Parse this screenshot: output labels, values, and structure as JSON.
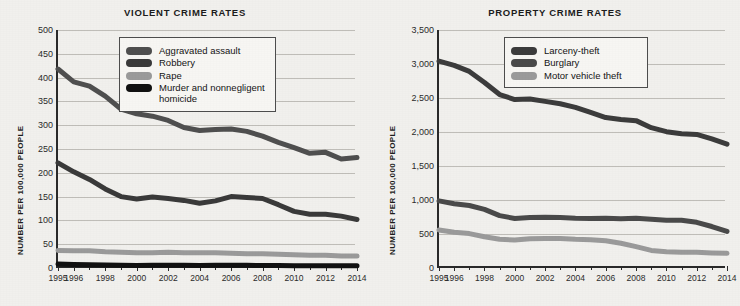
{
  "colors": {
    "background": "#f1f0ed",
    "axis": "#2a2a2a",
    "grid": "#bfbdb8",
    "series_dark_gray": "#4f4f4f",
    "series_darker_gray": "#3a3a3a",
    "series_light_gray": "#9a9a9a",
    "series_black": "#111111",
    "legend_bg": "#f7f6f3",
    "legend_border": "#4d4d4d"
  },
  "panels": [
    {
      "id": "violent-crime",
      "title": "VIOLENT CRIME RATES",
      "ylabel": "NUMBER PER 100,000 PEOPLE",
      "legend": {
        "items": [
          {
            "label": "Aggravated assault",
            "color": "#4f4f4f"
          },
          {
            "label": "Robbery",
            "color": "#3a3a3a"
          },
          {
            "label": "Rape",
            "color": "#9a9a9a"
          },
          {
            "label": "Murder and nonnegligent\nhomicide",
            "color": "#111111"
          }
        ]
      },
      "chart_data": {
        "type": "line",
        "title": "VIOLENT CRIME RATES",
        "xlabel": "",
        "ylabel": "NUMBER PER 100,000 PEOPLE",
        "ylim": [
          0,
          500
        ],
        "yticks": [
          0,
          50,
          100,
          150,
          200,
          250,
          300,
          350,
          400,
          450,
          500
        ],
        "ytick_labels": [
          "0",
          "50",
          "100",
          "150",
          "200",
          "250",
          "300",
          "350",
          "400",
          "450",
          "500"
        ],
        "xlim": [
          1995,
          2014
        ],
        "x": [
          1995,
          1996,
          1997,
          1998,
          1999,
          2000,
          2001,
          2002,
          2003,
          2004,
          2005,
          2006,
          2007,
          2008,
          2009,
          2010,
          2011,
          2012,
          2013,
          2014
        ],
        "xticks": [
          1995,
          1996,
          1998,
          2000,
          2002,
          2004,
          2006,
          2008,
          2010,
          2012,
          2014
        ],
        "xtick_labels": [
          "1995",
          "1996",
          "1998",
          "2000",
          "2002",
          "2004",
          "2006",
          "2008",
          "2010",
          "2012",
          "2014"
        ],
        "grid": true,
        "legend_position": "top-right",
        "series": [
          {
            "name": "Aggravated assault",
            "color": "#4f4f4f",
            "values": [
              418,
              391,
              382,
              361,
              334,
              324,
              319,
              310,
              295,
              289,
              291,
              292,
              287,
              277,
              264,
              253,
              241,
              243,
              229,
              232
            ]
          },
          {
            "name": "Robbery",
            "color": "#3a3a3a",
            "values": [
              221,
              202,
              186,
              166,
              150,
              145,
              149,
              146,
              142,
              136,
              141,
              150,
              148,
              146,
              133,
              119,
              113,
              113,
              109,
              102
            ]
          },
          {
            "name": "Rape",
            "color": "#9a9a9a",
            "values": [
              37,
              36,
              36,
              34,
              33,
              32,
              32,
              33,
              32,
              32,
              32,
              31,
              30,
              30,
              29,
              28,
              27,
              27,
              25,
              25
            ]
          },
          {
            "name": "Murder and nonnegligent homicide",
            "color": "#111111",
            "values": [
              8.2,
              7.4,
              6.8,
              6.3,
              5.7,
              5.5,
              5.6,
              5.6,
              5.7,
              5.5,
              5.6,
              5.7,
              5.6,
              5.4,
              5.0,
              4.8,
              4.7,
              4.7,
              4.5,
              4.5
            ]
          }
        ]
      }
    },
    {
      "id": "property-crime",
      "title": "PROPERTY CRIME RATES",
      "ylabel": "NUMBER PER 100,000 PEOPLE",
      "legend": {
        "items": [
          {
            "label": "Larceny-theft",
            "color": "#3c3c3c"
          },
          {
            "label": "Burglary",
            "color": "#4a4a4a"
          },
          {
            "label": "Motor vehicle theft",
            "color": "#9a9a9a"
          }
        ]
      },
      "chart_data": {
        "type": "line",
        "title": "PROPERTY CRIME RATES",
        "xlabel": "",
        "ylabel": "NUMBER PER 100,000 PEOPLE",
        "ylim": [
          0,
          3500
        ],
        "yticks": [
          0,
          500,
          1000,
          1500,
          2000,
          2500,
          3000,
          3500
        ],
        "ytick_labels": [
          "0",
          "500",
          "1,000",
          "1,500",
          "2,000",
          "2,500",
          "3,000",
          "3,500"
        ],
        "xlim": [
          1995,
          2014
        ],
        "x": [
          1995,
          1996,
          1997,
          1998,
          1999,
          2000,
          2001,
          2002,
          2003,
          2004,
          2005,
          2006,
          2007,
          2008,
          2009,
          2010,
          2011,
          2012,
          2013,
          2014
        ],
        "xticks": [
          1995,
          1996,
          1998,
          2000,
          2002,
          2004,
          2006,
          2008,
          2010,
          2012,
          2014
        ],
        "xtick_labels": [
          "1995",
          "1996",
          "1998",
          "2000",
          "2002",
          "2004",
          "2006",
          "2008",
          "2010",
          "2012",
          "2014"
        ],
        "grid": true,
        "legend_position": "top-right",
        "series": [
          {
            "name": "Larceny-theft",
            "color": "#3c3c3c",
            "values": [
              3043,
              2980,
              2891,
              2729,
              2551,
              2477,
              2485,
              2450,
              2416,
              2362,
              2287,
              2213,
              2185,
              2167,
              2064,
              2005,
              1974,
              1965,
              1899,
              1821
            ]
          },
          {
            "name": "Burglary",
            "color": "#4a4a4a",
            "values": [
              987,
              945,
              919,
              863,
              770,
              729,
              741,
              747,
              741,
              730,
              727,
              733,
              726,
              733,
              718,
              701,
              702,
              672,
              610,
              537
            ]
          },
          {
            "name": "Motor vehicle theft",
            "color": "#9a9a9a",
            "values": [
              560,
              526,
              506,
              460,
              422,
              412,
              431,
              432,
              433,
              422,
              417,
              400,
              364,
              315,
              259,
              239,
              230,
              230,
              222,
              216
            ]
          }
        ]
      }
    }
  ]
}
